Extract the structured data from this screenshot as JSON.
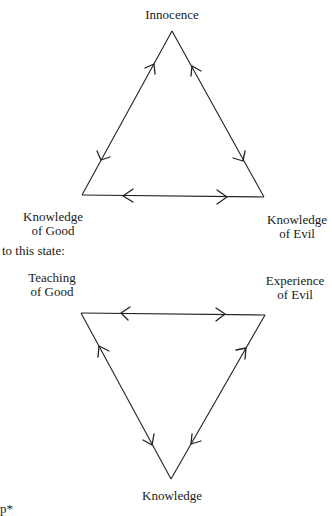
{
  "diagram": {
    "top_triangle": {
      "apex_label": "Innocence",
      "left_label": [
        "Knowledge",
        "of Good"
      ],
      "right_label": [
        "Knowledge",
        "of Evil"
      ]
    },
    "transition_text": "to this state:",
    "bottom_triangle": {
      "left_label": [
        "Teaching",
        "of Good"
      ],
      "right_label": [
        "Experience",
        "of Evil"
      ],
      "bottom_label": "Knowledge"
    },
    "footnote_fragment": "p*",
    "line_color": "#222222"
  }
}
